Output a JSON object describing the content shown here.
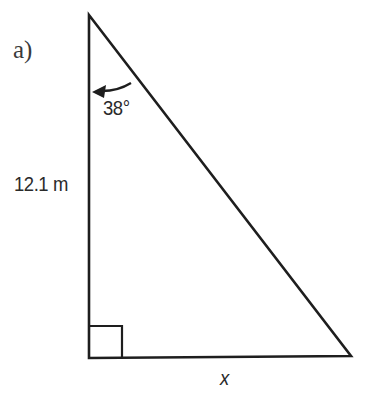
{
  "problem": {
    "part_label": "a)"
  },
  "triangle": {
    "type": "right triangle",
    "vertices": {
      "top": [
        89,
        15
      ],
      "bottom_left": [
        89,
        358
      ],
      "bottom_right": [
        351,
        356
      ]
    },
    "right_angle_at": "bottom_left",
    "vertical_side_label": "12.1 m",
    "base_label": "x",
    "angle_label": "38°",
    "angle_at": "top",
    "stroke_color": "#1e1e1e"
  }
}
